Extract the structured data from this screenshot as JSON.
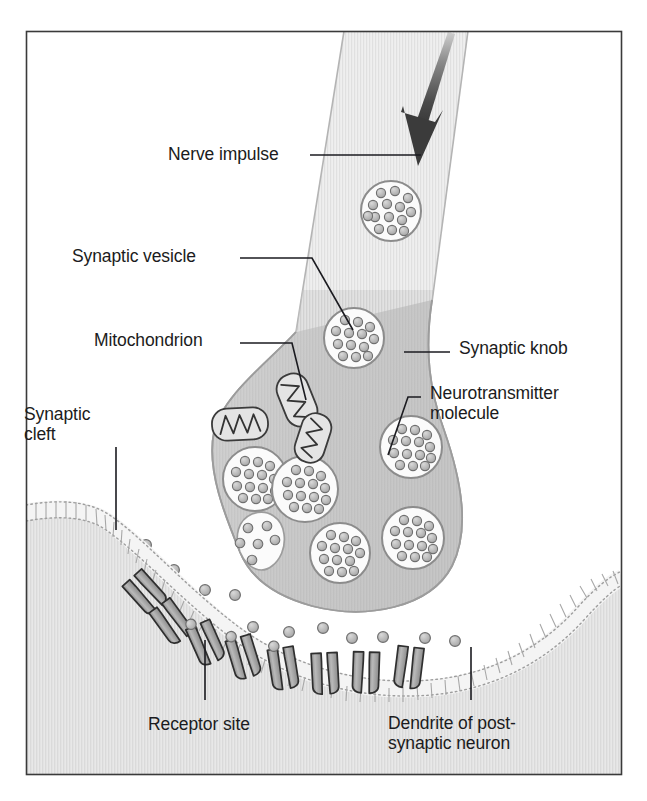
{
  "figure": {
    "frame": {
      "border_color": "#3a3a3a",
      "background": "#ffffff"
    },
    "palette": {
      "knob_fill": "#c9c9c9",
      "knob_outline": "#8e8e8e",
      "axon_fill": "#eaeaea",
      "axon_outline": "#a9a9a9",
      "vesicle_fill": "#fbfbfb",
      "vesicle_outline": "#8c8c8c",
      "molecule_fill": "#bdbdbd",
      "molecule_outline": "#6f6f6f",
      "mitochondrion_fill": "#e2e2e2",
      "mitochondrion_outline": "#3b3b3b",
      "postsynaptic_fill": "#e3e3e3",
      "membrane_line": "#9a9a9a",
      "receptor_fill": "#a8a8a8",
      "receptor_outline": "#2f2f2f",
      "arrow_color": "#3b3b3b",
      "leader_line": "#1b1b20",
      "text_color": "#1b1b20"
    }
  },
  "labels": [
    {
      "id": "nerve-impulse",
      "name": "label-nerve-impulse",
      "text": "Nerve impulse",
      "x": 168,
      "y": 144,
      "align": "left",
      "leader": {
        "type": "line",
        "points": "310,155 421,155"
      }
    },
    {
      "id": "synaptic-vesicle",
      "name": "label-synaptic-vesicle",
      "text": "Synaptic vesicle",
      "x": 72,
      "y": 246,
      "align": "left",
      "leader": {
        "type": "line",
        "points": "240,258 312,258 353,330"
      }
    },
    {
      "id": "mitochondrion",
      "name": "label-mitochondrion",
      "text": "Mitochondrion",
      "x": 94,
      "y": 330,
      "align": "left",
      "leader": {
        "type": "line",
        "points": "240,343 292,343 306,400"
      }
    },
    {
      "id": "synaptic-cleft",
      "name": "label-synaptic-cleft",
      "text": "Synaptic\ncleft",
      "x": 24,
      "y": 404,
      "align": "left",
      "leader": {
        "type": "line",
        "points": "116,447 116,530"
      }
    },
    {
      "id": "synaptic-knob",
      "name": "label-synaptic-knob",
      "text": "Synaptic knob",
      "x": 459,
      "y": 338,
      "align": "left",
      "leader": {
        "type": "line",
        "points": "404,352 450,352"
      }
    },
    {
      "id": "neurotransmitter-molecule",
      "name": "label-neurotransmitter-molecule",
      "text": "Neurotransmitter\nmolecule",
      "x": 430,
      "y": 383,
      "align": "left",
      "leader": {
        "type": "line",
        "points": "421,397 408,397 388,455"
      }
    },
    {
      "id": "receptor-site",
      "name": "label-receptor-site",
      "text": "Receptor site",
      "x": 148,
      "y": 714,
      "align": "left",
      "leader": {
        "type": "line",
        "points": "205,640 205,700"
      }
    },
    {
      "id": "dendrite",
      "name": "label-dendrite-of-postsynaptic-neuron",
      "text": "Dendrite of post-\nsynaptic neuron",
      "x": 388,
      "y": 713,
      "align": "left",
      "leader": {
        "type": "line",
        "points": "471,647 471,700"
      }
    }
  ],
  "structures": {
    "axon": {
      "name": "axon-presynaptic",
      "description": "Presynaptic axon entering from top right"
    },
    "synaptic_knob": {
      "name": "synaptic-knob",
      "description": "Bulbous axon terminal"
    },
    "postsynaptic_cell": {
      "name": "postsynaptic-dendrite",
      "description": "Dendrite of post-synaptic neuron across the cleft"
    },
    "synaptic_cleft": {
      "name": "synaptic-cleft",
      "description": "Gap between knob and dendrite"
    }
  },
  "vesicles": [
    {
      "name": "synaptic-vesicle",
      "cx": 391,
      "cy": 211,
      "r": 30,
      "molecules": 14,
      "in": "axon"
    },
    {
      "name": "synaptic-vesicle",
      "cx": 354,
      "cy": 338,
      "r": 30,
      "molecules": 13,
      "in": "knob"
    },
    {
      "name": "synaptic-vesicle",
      "cx": 255,
      "cy": 479,
      "r": 32,
      "molecules": 14,
      "in": "knob"
    },
    {
      "name": "synaptic-vesicle",
      "cx": 305,
      "cy": 489,
      "r": 33,
      "molecules": 14,
      "in": "knob"
    },
    {
      "name": "synaptic-vesicle",
      "cx": 411,
      "cy": 447,
      "r": 31,
      "molecules": 14,
      "in": "knob"
    },
    {
      "name": "synaptic-vesicle",
      "cx": 340,
      "cy": 553,
      "r": 30,
      "molecules": 13,
      "in": "knob"
    },
    {
      "name": "synaptic-vesicle",
      "cx": 413,
      "cy": 538,
      "r": 31,
      "molecules": 14,
      "in": "knob"
    },
    {
      "name": "fusing-vesicle",
      "cx": 256,
      "cy": 560,
      "r": 23,
      "molecules": 6,
      "in": "membrane-fusion"
    }
  ],
  "mitochondria": [
    {
      "name": "mitochondrion",
      "cx": 297,
      "cy": 400,
      "rx": 17,
      "ry": 27,
      "rotation": -22
    },
    {
      "name": "mitochondrion",
      "cx": 240,
      "cy": 424,
      "rx": 27,
      "ry": 16,
      "rotation": -3
    },
    {
      "name": "mitochondrion",
      "cx": 313,
      "cy": 438,
      "rx": 15,
      "ry": 25,
      "rotation": 18
    }
  ],
  "free_molecules": [
    {
      "cx": 146,
      "cy": 545
    },
    {
      "cx": 174,
      "cy": 570
    },
    {
      "cx": 205,
      "cy": 590
    },
    {
      "cx": 235,
      "cy": 595
    },
    {
      "cx": 192,
      "cy": 630
    },
    {
      "cx": 253,
      "cy": 627
    },
    {
      "cx": 289,
      "cy": 632
    },
    {
      "cx": 323,
      "cy": 628
    },
    {
      "cx": 352,
      "cy": 638
    },
    {
      "cx": 383,
      "cy": 637
    },
    {
      "cx": 425,
      "cy": 638
    },
    {
      "cx": 455,
      "cy": 641
    }
  ],
  "receptors": [
    {
      "name": "receptor-site",
      "x": 144,
      "y": 591,
      "angle": -42,
      "bound": false
    },
    {
      "name": "receptor-site",
      "x": 170,
      "y": 620,
      "angle": -36,
      "bound": false
    },
    {
      "name": "receptor-site",
      "x": 205,
      "y": 641,
      "angle": -24,
      "bound": true
    },
    {
      "name": "receptor-site",
      "x": 243,
      "y": 655,
      "angle": -17,
      "bound": true
    },
    {
      "name": "receptor-site",
      "x": 283,
      "y": 666,
      "angle": -9,
      "bound": true
    },
    {
      "name": "receptor-site",
      "x": 325,
      "y": 671,
      "angle": -3,
      "bound": false
    },
    {
      "name": "receptor-site",
      "x": 366,
      "y": 670,
      "angle": 2,
      "bound": false
    },
    {
      "name": "receptor-site",
      "x": 409,
      "y": 665,
      "angle": 7,
      "bound": false
    }
  ],
  "arrow": {
    "name": "nerve-impulse-arrow",
    "description": "Tapered arrow pointing down-right inside axon",
    "from": {
      "x": 445,
      "y": 38
    },
    "to": {
      "x": 418,
      "y": 162
    }
  }
}
